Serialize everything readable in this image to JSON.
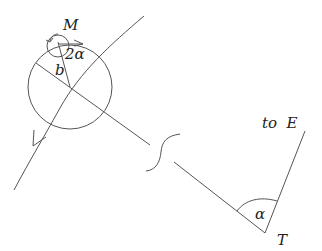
{
  "diagram": {
    "labels": {
      "M": "M",
      "two_alpha": "2α",
      "b": "b",
      "to_E": "to  E",
      "alpha": "α",
      "T": "T"
    },
    "colors": {
      "stroke": "#555555",
      "text": "#222222",
      "background": "#ffffff"
    }
  }
}
